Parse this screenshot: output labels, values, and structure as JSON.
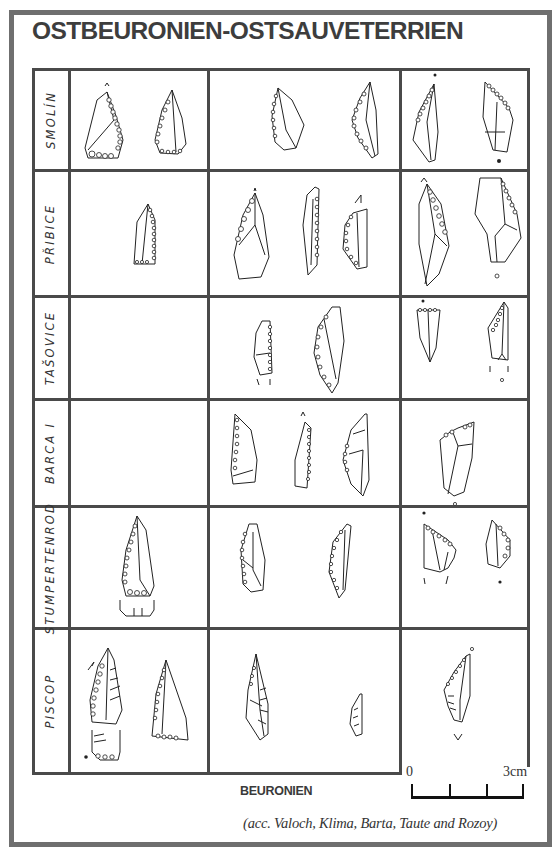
{
  "title": "OSTBEURONIEN-OSTSAUVETERRIEN",
  "rows": [
    {
      "label": "SMOLÍN"
    },
    {
      "label": "PŘIBICE"
    },
    {
      "label": "TAŠOVICE"
    },
    {
      "label": "BARCA I"
    },
    {
      "label": "STUMPERTENROD"
    },
    {
      "label": "PISCOP"
    }
  ],
  "columns": [
    "early",
    "middle",
    "late"
  ],
  "footer": {
    "column_label": "BEURONIEN",
    "citation": "(acc. Valoch, Klima, Barta, Taute and Rozoy)"
  },
  "scale": {
    "start_label": "0",
    "end_label": "3cm"
  },
  "colors": {
    "frame": "#6f6f6f",
    "grid": "#4a4a4a",
    "title": "#3d3d3d",
    "ink": "#222222"
  }
}
